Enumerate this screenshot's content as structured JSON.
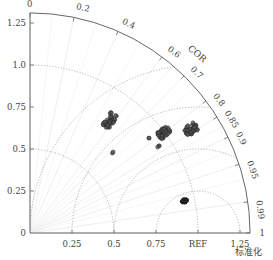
{
  "chart_data": {
    "type": "taylor",
    "title": "",
    "xlabel": "标准化",
    "corr_label": "COR",
    "ref_label": "REF",
    "ref_std": 1.0,
    "std_max": 1.31,
    "std_ticks": [
      0,
      0.25,
      0.5,
      0.75,
      1.0,
      1.25
    ],
    "y_tick_labels": [
      "0",
      "0.25",
      "0.5",
      "0.75",
      "1.0",
      "1.25"
    ],
    "x_tick_labels": [
      "0.25",
      "0.5",
      "0.75",
      "REF",
      "1.25"
    ],
    "corr_ticks": [
      0,
      0.2,
      0.4,
      0.6,
      0.7,
      0.8,
      0.85,
      0.9,
      0.95,
      0.99,
      1
    ],
    "corr_tick_labels": [
      "0",
      "0.2",
      "0.4",
      "0.6",
      "0.7",
      "0.8",
      "0.85",
      "0.9",
      "0.95",
      "0.99",
      "1"
    ],
    "std_arcs": [
      0.5,
      1.0
    ],
    "rms_arcs": [
      0.25,
      0.5,
      0.75,
      1.0
    ],
    "grid": true,
    "series": [
      {
        "name": "cluster-a",
        "color": "#555555",
        "std": 0.82,
        "corr": 0.58,
        "spread": 0.05,
        "count": 45
      },
      {
        "name": "cluster-b",
        "color": "#555555",
        "std": 1.0,
        "corr": 0.8,
        "spread": 0.04,
        "count": 45
      },
      {
        "name": "cluster-c",
        "color": "#555555",
        "std": 1.14,
        "corr": 0.84,
        "spread": 0.04,
        "count": 40
      },
      {
        "name": "point-d",
        "color": "#555555",
        "std": 0.69,
        "corr": 0.72,
        "spread": 0.01,
        "count": 2
      },
      {
        "name": "point-e",
        "color": "#555555",
        "std": 0.91,
        "corr": 0.78,
        "spread": 0.01,
        "count": 2
      },
      {
        "name": "point-f",
        "color": "#555555",
        "std": 0.92,
        "corr": 0.83,
        "spread": 0.01,
        "count": 3
      },
      {
        "name": "cluster-g",
        "color": "#222222",
        "std": 0.94,
        "corr": 0.979,
        "spread": 0.015,
        "count": 30
      }
    ]
  }
}
